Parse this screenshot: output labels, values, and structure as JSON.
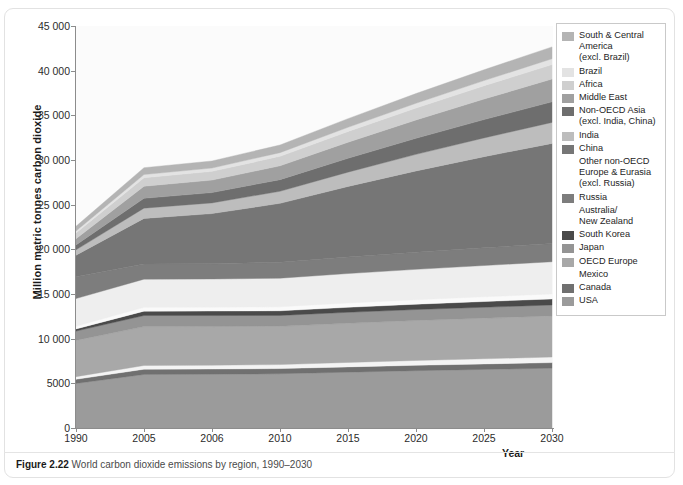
{
  "figure": {
    "caption_number": "Figure 2.22",
    "caption_text": " World carbon dioxide emissions by region, 1990–2030"
  },
  "axes": {
    "y_title": "Million metric tonnes carbon dioxide",
    "x_title": "Year",
    "y_ticks": [
      "45 000",
      "40 000",
      "35 000",
      "30 000",
      "25 000",
      "20 000",
      "15 000",
      "10 000",
      "5000",
      "0"
    ],
    "x_ticks": [
      "1990",
      "2005",
      "2006",
      "2010",
      "2015",
      "2020",
      "2025",
      "2030"
    ]
  },
  "legend": {
    "items": [
      {
        "label": "South & Central\nAmerica\n(excl. Brazil)",
        "color": "#b4b4b4"
      },
      {
        "label": "Brazil",
        "color": "#e3e3e3"
      },
      {
        "label": "Africa",
        "color": "#cfcfcf"
      },
      {
        "label": "Middle East",
        "color": "#a0a0a0"
      },
      {
        "label": "Non-OECD Asia\n(excl. India, China)",
        "color": "#6e6e6e"
      },
      {
        "label": "India",
        "color": "#bdbdbd"
      },
      {
        "label": "China",
        "color": "#767676"
      },
      {
        "label": "Other non-OECD\nEurope & Eurasia\n(excl. Russia)",
        "color": "#eeeeee"
      },
      {
        "label": "Russia",
        "color": "#7d7d7d"
      },
      {
        "label": "Australia/\nNew Zealand",
        "color": "#fafafa"
      },
      {
        "label": "South Korea",
        "color": "#4a4a4a"
      },
      {
        "label": "Japan",
        "color": "#949494"
      },
      {
        "label": "OECD Europe",
        "color": "#a8a8a8"
      },
      {
        "label": "Mexico",
        "color": "#f4f4f4"
      },
      {
        "label": "Canada",
        "color": "#707070"
      },
      {
        "label": "USA",
        "color": "#9b9b9b"
      }
    ]
  },
  "chart_data": {
    "type": "area",
    "title": "World carbon dioxide emissions by region, 1990–2030",
    "xlabel": "Year",
    "ylabel": "Million metric tonnes carbon dioxide",
    "ylim": [
      0,
      45000
    ],
    "grid": false,
    "legend_position": "right",
    "stacked": true,
    "units": "Million metric tonnes carbon dioxide",
    "categories": [
      "1990",
      "2005",
      "2006",
      "2010",
      "2015",
      "2020",
      "2025",
      "2030"
    ],
    "series": [
      {
        "name": "USA",
        "color": "#9b9b9b",
        "values": [
          4990,
          6000,
          6020,
          6080,
          6250,
          6420,
          6560,
          6700
        ]
      },
      {
        "name": "Canada",
        "color": "#707070",
        "values": [
          460,
          580,
          580,
          570,
          590,
          600,
          610,
          620
        ]
      },
      {
        "name": "Mexico",
        "color": "#f4f4f4",
        "values": [
          300,
          420,
          430,
          450,
          500,
          540,
          580,
          620
        ]
      },
      {
        "name": "OECD Europe",
        "color": "#a8a8a8",
        "values": [
          4050,
          4350,
          4330,
          4280,
          4380,
          4470,
          4540,
          4600
        ]
      },
      {
        "name": "Japan",
        "color": "#949494",
        "values": [
          1050,
          1240,
          1230,
          1220,
          1230,
          1230,
          1230,
          1230
        ]
      },
      {
        "name": "South Korea",
        "color": "#4a4a4a",
        "values": [
          240,
          490,
          500,
          520,
          560,
          600,
          640,
          680
        ]
      },
      {
        "name": "Australia/New Zealand",
        "color": "#fafafa",
        "values": [
          300,
          430,
          440,
          450,
          480,
          500,
          530,
          560
        ]
      },
      {
        "name": "Other non-OECD Europe & Eurasia (excl. Russia)",
        "color": "#eeeeee",
        "values": [
          3100,
          3150,
          3150,
          3200,
          3300,
          3400,
          3500,
          3600
        ]
      },
      {
        "name": "Russia",
        "color": "#7d7d7d",
        "values": [
          2450,
          1700,
          1720,
          1780,
          1850,
          1920,
          1980,
          2050
        ]
      },
      {
        "name": "China",
        "color": "#767676",
        "values": [
          2400,
          5100,
          5600,
          6600,
          7900,
          9100,
          10200,
          11200
        ]
      },
      {
        "name": "India",
        "color": "#bdbdbd",
        "values": [
          600,
          1150,
          1200,
          1350,
          1600,
          1850,
          2100,
          2350
        ]
      },
      {
        "name": "Non-OECD Asia (excl. India, China)",
        "color": "#6e6e6e",
        "values": [
          550,
          1100,
          1150,
          1300,
          1550,
          1800,
          2050,
          2300
        ]
      },
      {
        "name": "Middle East",
        "color": "#a0a0a0",
        "values": [
          700,
          1350,
          1400,
          1550,
          1800,
          2050,
          2300,
          2550
        ]
      },
      {
        "name": "Africa",
        "color": "#cfcfcf",
        "values": [
          650,
          950,
          980,
          1060,
          1200,
          1340,
          1480,
          1620
        ]
      },
      {
        "name": "Brazil",
        "color": "#e3e3e3",
        "values": [
          220,
          360,
          370,
          410,
          470,
          530,
          590,
          650
        ]
      },
      {
        "name": "South & Central America (excl. Brazil)",
        "color": "#b4b4b4",
        "values": [
          520,
          770,
          790,
          860,
          970,
          1090,
          1210,
          1330
        ]
      }
    ],
    "totals": [
      21580,
      29140,
      29890,
      31680,
      34630,
      37440,
      40100,
      42660
    ]
  }
}
